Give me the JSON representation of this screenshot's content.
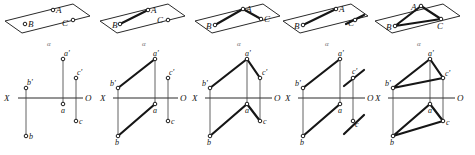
{
  "figure": {
    "stage_count": 5,
    "plane_label": "α",
    "axis": {
      "left_label": "X",
      "right_label": "O"
    },
    "pictorial_labels": {
      "a": "A",
      "b": "B",
      "c": "C"
    },
    "projection_labels": {
      "a_front": "a'",
      "b_front": "b'",
      "c_front": "c'",
      "a_top": "a",
      "b_top": "b",
      "c_top": "c"
    },
    "stages": [
      {
        "id": 1,
        "pictorial_edges": [],
        "front_edges": [],
        "top_edges": [],
        "extras_front": [],
        "extras_top": []
      },
      {
        "id": 2,
        "pictorial_edges": [
          "B-A"
        ],
        "front_edges": [
          "b'-a'"
        ],
        "top_edges": [
          "b-a"
        ],
        "extras_front": [],
        "extras_top": []
      },
      {
        "id": 3,
        "pictorial_edges": [
          "B-A",
          "A-C"
        ],
        "front_edges": [
          "b'-a'",
          "a'-c'"
        ],
        "top_edges": [
          "b-a",
          "a-c"
        ],
        "extras_front": [],
        "extras_top": []
      },
      {
        "id": 4,
        "pictorial_edges": [
          "B-A"
        ],
        "front_edges": [
          "b'-a'"
        ],
        "top_edges": [
          "b-a"
        ],
        "extras_front": [
          "stroke-through-c'"
        ],
        "extras_top": [
          "stroke-through-c"
        ]
      },
      {
        "id": 5,
        "pictorial_edges": [
          "B-A",
          "A-C",
          "C-B"
        ],
        "front_edges": [
          "b'-a'",
          "a'-c'",
          "c'-b'"
        ],
        "top_edges": [
          "b-a",
          "a-c",
          "c-b"
        ],
        "extras_front": [],
        "extras_top": []
      }
    ]
  }
}
